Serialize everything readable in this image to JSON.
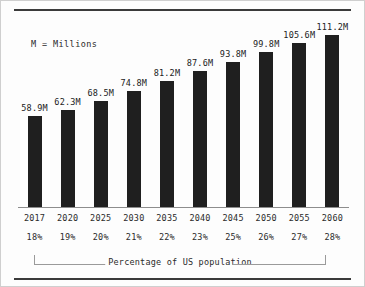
{
  "note": "M = Millions",
  "bracket_label": "Percentage of US population",
  "colors": {
    "bar": "#1f1f1f",
    "rule": "#3b3b3b",
    "axis": "#8d8d8d",
    "text": "#2b2b2b",
    "background": "#fdfdfd",
    "frame": "#cfcfcf"
  },
  "chart_data": {
    "type": "bar",
    "title": "",
    "subtitle": "",
    "xlabel": "Percentage of US population",
    "ylabel": "",
    "ylim": [
      0,
      120
    ],
    "grid": false,
    "legend": "none",
    "annotations": [
      "M = Millions",
      "Percentage of US population"
    ],
    "categories": [
      "2017",
      "2020",
      "2025",
      "2030",
      "2035",
      "2040",
      "2045",
      "2050",
      "2055",
      "2060"
    ],
    "values": [
      58.9,
      62.3,
      68.5,
      74.8,
      81.2,
      87.6,
      93.8,
      99.8,
      105.6,
      111.2
    ],
    "value_labels": [
      "58.9M",
      "62.3M",
      "68.5M",
      "74.8M",
      "81.2M",
      "87.6M",
      "93.8M",
      "99.8M",
      "105.6M",
      "111.2M"
    ],
    "percent_labels": [
      "18%",
      "19%",
      "20%",
      "21%",
      "22%",
      "23%",
      "25%",
      "26%",
      "27%",
      "28%"
    ],
    "percent_values": [
      18,
      19,
      20,
      21,
      22,
      23,
      25,
      26,
      27,
      28
    ],
    "units": "millions"
  }
}
